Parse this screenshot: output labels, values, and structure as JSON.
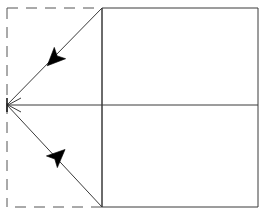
{
  "canvas": {
    "width": 263,
    "height": 215,
    "background": "#ffffff"
  },
  "style": {
    "stroke_color": "#3a3a3a",
    "stroke_color_dark": "#1a1a1a",
    "fill_color": "#000000",
    "stroke_width": 1,
    "dash_pattern": "11 8"
  },
  "chart_data": {
    "type": "line",
    "title": "",
    "xlabel": "",
    "ylabel": "",
    "xlim": [
      0,
      263
    ],
    "ylim": [
      0,
      215
    ],
    "grid": false,
    "legend": "none",
    "points": {
      "apex": [
        7,
        105
      ],
      "top_left_inner": [
        102,
        8
      ],
      "bottom_left_inner": [
        102,
        207
      ],
      "top_right": [
        258,
        8
      ],
      "bottom_right": [
        258,
        207
      ],
      "dash_top_left": [
        7,
        8
      ],
      "dash_bottom_left": [
        7,
        207
      ]
    },
    "series": [
      {
        "name": "solid-rectangle",
        "style": "solid",
        "x": [
          102,
          258,
          258,
          102
        ],
        "y": [
          8,
          8,
          207,
          207
        ]
      },
      {
        "name": "vertical-divider",
        "style": "solid",
        "x": [
          102,
          102
        ],
        "y": [
          8,
          207
        ]
      },
      {
        "name": "horizontal-center-axis",
        "style": "solid",
        "x": [
          7,
          258
        ],
        "y": [
          105,
          105
        ]
      },
      {
        "name": "dashed-rectangle",
        "style": "dashed",
        "x": [
          7,
          102,
          102,
          7
        ],
        "y": [
          8,
          8,
          207,
          207
        ]
      },
      {
        "name": "upper-diagonal",
        "style": "solid",
        "x": [
          7,
          102
        ],
        "y": [
          105,
          8
        ]
      },
      {
        "name": "lower-diagonal",
        "style": "solid",
        "x": [
          7,
          102
        ],
        "y": [
          105,
          207
        ]
      }
    ],
    "annotations": [
      {
        "name": "upper-arrowhead",
        "shape": "filled-arrow",
        "position": [
          55,
          58
        ],
        "direction": "down-left",
        "angle_deg": 225,
        "size": 22
      },
      {
        "name": "lower-arrowhead",
        "shape": "filled-arrow",
        "position": [
          57,
          157
        ],
        "direction": "down-right",
        "angle_deg": 47,
        "size": 22
      },
      {
        "name": "apex-arrow-marker",
        "shape": "open-chevron",
        "position": [
          7,
          105
        ],
        "direction": "left",
        "size": 14
      },
      {
        "name": "apex-tick",
        "shape": "vertical-tick",
        "position": [
          7,
          105
        ],
        "size": 14
      }
    ]
  }
}
